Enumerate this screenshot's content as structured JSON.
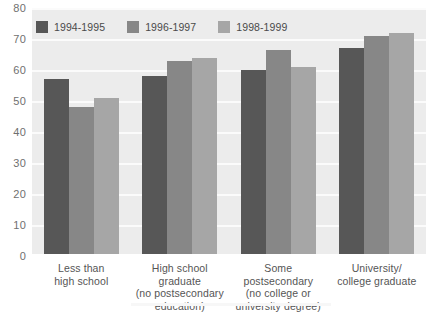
{
  "chart_data": {
    "type": "bar",
    "title": "",
    "subtitle": "",
    "xlabel": "",
    "ylabel": "",
    "ylim": [
      0,
      80
    ],
    "yticks": [
      80,
      70,
      60,
      50,
      40,
      30,
      20,
      10,
      0
    ],
    "grid": true,
    "legend_position": "top-left",
    "categories": [
      "Less than\nhigh school",
      "High school graduate\n(no postsecondary\neducation)",
      "Some postsecondary\n(no college or\nuniversity degree)",
      "University/\ncollege graduate"
    ],
    "series": [
      {
        "name": "1994-1995",
        "color": "#575757",
        "values": [
          57,
          58,
          60,
          67
        ]
      },
      {
        "name": "1996-1997",
        "color": "#878787",
        "values": [
          48,
          63,
          66.5,
          71
        ]
      },
      {
        "name": "1998-1999",
        "color": "#a6a6a6",
        "values": [
          51,
          64,
          61,
          72
        ]
      }
    ]
  },
  "axis": {
    "y_tick_labels": [
      "80",
      "70",
      "60",
      "50",
      "40",
      "30",
      "20",
      "10",
      "0"
    ]
  },
  "legend": {
    "items": [
      {
        "label": "1994-1995"
      },
      {
        "label": "1996-1997"
      },
      {
        "label": "1998-1999"
      }
    ]
  },
  "x_labels": [
    {
      "lines": [
        "Less than",
        "high school"
      ]
    },
    {
      "lines": [
        "High school graduate",
        "(no postsecondary",
        "education)"
      ]
    },
    {
      "lines": [
        "Some postsecondary",
        "(no college or",
        "university degree)"
      ]
    },
    {
      "lines": [
        "University/",
        "college graduate"
      ]
    }
  ],
  "colors": {
    "plot_background": "#ececec",
    "gridline": "#fbfbfb",
    "page_background": "#ffffff",
    "tick_text": "#6f6f6f",
    "label_text": "#555555"
  }
}
